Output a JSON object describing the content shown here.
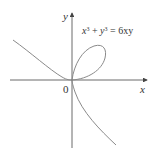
{
  "figure": {
    "equation": "x³ + y³ = 6xy",
    "equation_parts": {
      "x": "x",
      "exp1": "3",
      "plus": " + ",
      "y": "y",
      "exp2": "3",
      "eq": " = 6xy"
    },
    "x_axis_label": "x",
    "y_axis_label": "y",
    "origin_label": "0",
    "curve_name": "folium of Descartes",
    "colors": {
      "curve": "#8a8a8a",
      "axis": "#444444",
      "text": "#333333"
    }
  }
}
